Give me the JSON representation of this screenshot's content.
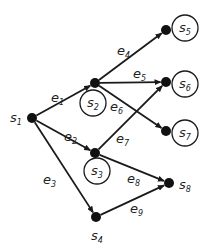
{
  "diagram": {
    "type": "directed-graph",
    "colors": {
      "edge": "#1a1a1a",
      "node": "#111111",
      "loop": "#1a1a1a",
      "text": "#222222"
    },
    "nodes": [
      {
        "id": "s1",
        "label": "s",
        "sub": "1",
        "self_loop": false
      },
      {
        "id": "s2",
        "label": "s",
        "sub": "2",
        "self_loop": true
      },
      {
        "id": "s3",
        "label": "s",
        "sub": "3",
        "self_loop": true
      },
      {
        "id": "s4",
        "label": "s",
        "sub": "4",
        "self_loop": false
      },
      {
        "id": "s5",
        "label": "s",
        "sub": "5",
        "self_loop": true
      },
      {
        "id": "s6",
        "label": "s",
        "sub": "6",
        "self_loop": true
      },
      {
        "id": "s7",
        "label": "s",
        "sub": "7",
        "self_loop": true
      },
      {
        "id": "s8",
        "label": "s",
        "sub": "8",
        "self_loop": false
      }
    ],
    "edges": [
      {
        "id": "e1",
        "label": "e",
        "sub": "1",
        "from": "s1",
        "to": "s2"
      },
      {
        "id": "e2",
        "label": "e",
        "sub": "2",
        "from": "s1",
        "to": "s3"
      },
      {
        "id": "e3",
        "label": "e",
        "sub": "3",
        "from": "s1",
        "to": "s4"
      },
      {
        "id": "e4",
        "label": "e",
        "sub": "4",
        "from": "s2",
        "to": "s5"
      },
      {
        "id": "e5",
        "label": "e",
        "sub": "5",
        "from": "s2",
        "to": "s6"
      },
      {
        "id": "e6",
        "label": "e",
        "sub": "6",
        "from": "s2",
        "to": "s7"
      },
      {
        "id": "e7",
        "label": "e",
        "sub": "7",
        "from": "s3",
        "to": "s6"
      },
      {
        "id": "e8",
        "label": "e",
        "sub": "8",
        "from": "s3",
        "to": "s8"
      },
      {
        "id": "e9",
        "label": "e",
        "sub": "9",
        "from": "s4",
        "to": "s8"
      }
    ]
  }
}
